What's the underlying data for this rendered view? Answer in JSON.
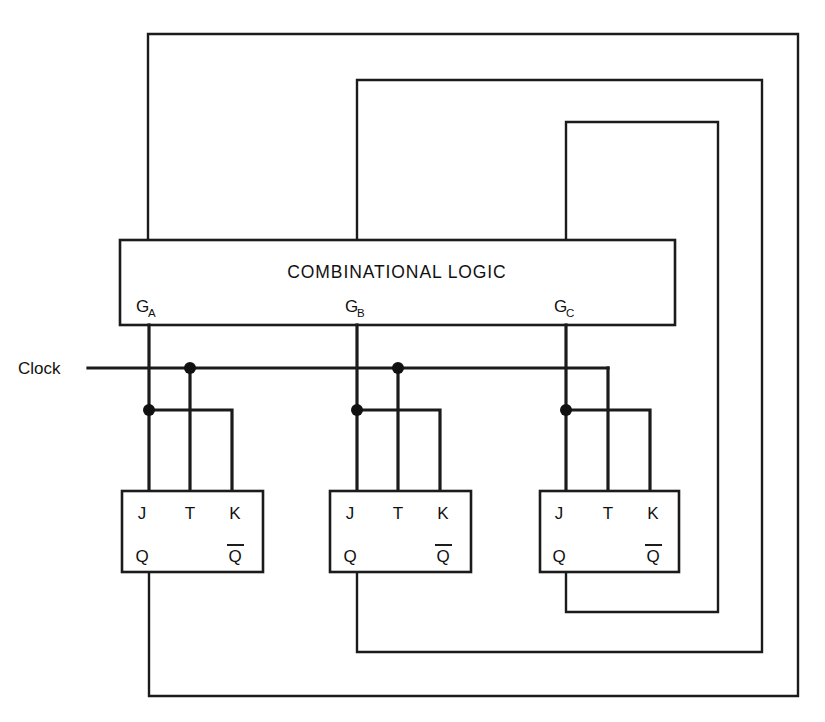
{
  "diagram": {
    "combinational_block": {
      "label": "COMBINATIONAL LOGIC",
      "outputs": [
        {
          "name": "G_A",
          "base": "G",
          "sub": "A"
        },
        {
          "name": "G_B",
          "base": "G",
          "sub": "B"
        },
        {
          "name": "G_C",
          "base": "G",
          "sub": "C"
        }
      ]
    },
    "clock": {
      "label": "Clock"
    },
    "flipflops": [
      {
        "id": "ff-a",
        "inputs": [
          "J",
          "T",
          "K"
        ],
        "outputs": [
          "Q",
          "Q"
        ],
        "output_inverted": [
          false,
          true
        ]
      },
      {
        "id": "ff-b",
        "inputs": [
          "J",
          "T",
          "K"
        ],
        "outputs": [
          "Q",
          "Q"
        ],
        "output_inverted": [
          false,
          true
        ]
      },
      {
        "id": "ff-c",
        "inputs": [
          "J",
          "T",
          "K"
        ],
        "outputs": [
          "Q",
          "Q"
        ],
        "output_inverted": [
          false,
          true
        ]
      }
    ],
    "colors": {
      "ink": "#1b1b1b",
      "paper": "#ffffff"
    }
  }
}
